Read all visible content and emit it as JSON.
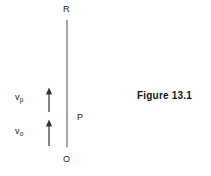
{
  "figure": {
    "caption": "Figure 13.1",
    "background_color": "#ffffff",
    "line_color": "#555555",
    "text_color": "#1a1a1a"
  },
  "diagram": {
    "type": "physics-vector-diagram",
    "vertical_axis": {
      "name": "tower-line",
      "top_label": "R",
      "bottom_label": "O",
      "x": 67,
      "y_top": 20,
      "y_bottom": 147
    },
    "horizontal_axis": {
      "name": "ground-line",
      "y": 147,
      "x_start": 0,
      "x_end": 136
    },
    "point_labels": [
      {
        "id": "R",
        "text": "R",
        "description": "top of vertical line"
      },
      {
        "id": "O",
        "text": "O",
        "description": "origin at base of vertical line"
      },
      {
        "id": "P",
        "text": "P",
        "description": "point on vertical line above origin"
      }
    ],
    "vectors": [
      {
        "id": "vp",
        "symbol": "v",
        "subscript": "p",
        "direction": "up",
        "x": 49,
        "y_tail": 112,
        "y_head": 88
      },
      {
        "id": "vo",
        "symbol": "v",
        "subscript": "o",
        "direction": "up",
        "x": 49,
        "y_tail": 146,
        "y_head": 120
      }
    ]
  }
}
